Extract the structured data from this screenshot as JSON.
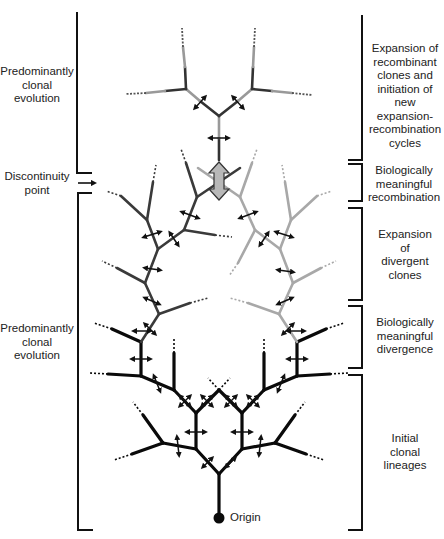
{
  "colors": {
    "initial_lineage": "#0a0a0a",
    "divergent_left": "#3a3a3a",
    "divergent_right": "#a8a8a8",
    "recombinant": "#555555",
    "recombination_arrow_fill": "#b8b8b8",
    "bracket": "#111111"
  },
  "left_labels": [
    {
      "id": "top-clonal",
      "text_lines": [
        "Predominantly",
        "clonal",
        "evolution"
      ]
    },
    {
      "id": "discontinuity",
      "text_lines": [
        "Discontinuity",
        "point"
      ]
    },
    {
      "id": "bottom-clonal",
      "text_lines": [
        "Predominantly",
        "clonal",
        "evolution"
      ]
    }
  ],
  "right_labels": [
    {
      "id": "expansion-recombinant",
      "text_lines": [
        "Expansion of",
        "recombinant",
        "clones and",
        "initiation of",
        "new expansion-",
        "recombination",
        "cycles"
      ]
    },
    {
      "id": "meaningful-recombination",
      "text_lines": [
        "Biologically",
        "meaningful",
        "recombination"
      ]
    },
    {
      "id": "expansion-divergent",
      "text_lines": [
        "Expansion",
        "of",
        "divergent",
        "clones"
      ]
    },
    {
      "id": "meaningful-divergence",
      "text_lines": [
        "Biologically",
        "meaningful",
        "divergence"
      ]
    },
    {
      "id": "initial-lineages",
      "text_lines": [
        "Initial",
        "clonal",
        "lineages"
      ]
    }
  ],
  "origin": {
    "label": "Origin"
  }
}
